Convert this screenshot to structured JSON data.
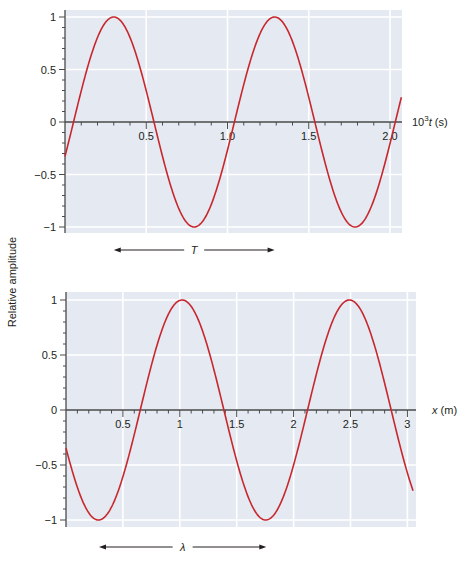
{
  "figure": {
    "ylabel": "Relative amplitude",
    "colors": {
      "curve": "#c8282d",
      "plot_bg": "#e4e9f2",
      "grid": "#ffffff",
      "axis": "#4a4a4a",
      "text": "#231f20"
    }
  },
  "chart_data": [
    {
      "type": "line",
      "title": "",
      "xlabel": "10^3 t (s)",
      "xlabel_parts": {
        "base": "10",
        "sup": "3",
        "var": "t",
        "unit": " (s)"
      },
      "ylabel": "Relative amplitude",
      "xlim": [
        0,
        2.07
      ],
      "ylim": [
        -1,
        1
      ],
      "xticks": [
        0.5,
        1.0,
        1.5,
        2.0
      ],
      "xtick_labels": [
        "0.5",
        "1.0",
        "1.5",
        "2.0"
      ],
      "xminor_step": 0.1,
      "yticks": [
        1,
        0.5,
        0,
        -0.5,
        -1
      ],
      "ytick_labels": [
        "1",
        "0.5",
        "0",
        "−0.5",
        "−1"
      ],
      "yminor_step": 0.1,
      "grid": true,
      "series": [
        {
          "name": "displacement vs time",
          "function": "sin",
          "amplitude": 1,
          "period": 0.99,
          "peak_at": 0.3,
          "x": [
            0.0,
            0.05,
            0.3,
            0.545,
            0.79,
            1.04,
            1.29,
            1.535,
            1.78,
            2.03,
            2.06
          ],
          "y": [
            -0.32,
            0,
            1,
            0,
            -1,
            0,
            1,
            0,
            -1,
            0,
            0.1
          ]
        }
      ],
      "annotation": {
        "label": "T",
        "from": 0.3,
        "to": 1.29,
        "meaning": "period"
      }
    },
    {
      "type": "line",
      "title": "",
      "xlabel": "x (m)",
      "xlabel_parts": {
        "var": "x",
        "unit": " (m)"
      },
      "ylabel": "Relative amplitude",
      "xlim": [
        0,
        3.05
      ],
      "ylim": [
        -1,
        1
      ],
      "xticks": [
        0.5,
        1,
        1.5,
        2,
        2.5,
        3
      ],
      "xtick_labels": [
        "0.5",
        "1",
        "1.5",
        "2",
        "2.5",
        "3"
      ],
      "xminor_step": 0.1,
      "yticks": [
        1,
        0.5,
        0,
        -0.5,
        -1
      ],
      "ytick_labels": [
        "1",
        "0.5",
        "0",
        "−0.5",
        "−1"
      ],
      "yminor_step": 0.1,
      "grid": true,
      "series": [
        {
          "name": "displacement vs position",
          "function": "sin",
          "amplitude": 1,
          "wavelength": 1.47,
          "peak_at": 1.02,
          "x": [
            0.0,
            0.285,
            0.65,
            1.02,
            1.385,
            1.755,
            2.12,
            2.49,
            2.855,
            3.05
          ],
          "y": [
            -0.3,
            -1,
            0,
            1,
            0,
            -1,
            0,
            1,
            0,
            -0.93
          ]
        }
      ],
      "annotation": {
        "label": "λ",
        "from": 0.29,
        "to": 1.76,
        "meaning": "wavelength"
      }
    }
  ]
}
